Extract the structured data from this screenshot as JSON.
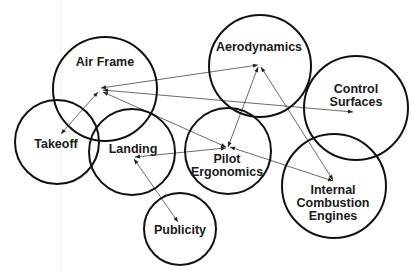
{
  "diagram": {
    "type": "concept-map",
    "style": {
      "line_color": "#444444",
      "circle_color": "#111111",
      "background": "#ffffff"
    },
    "nodes": [
      {
        "id": "airframe",
        "label_lines": [
          "Air Frame"
        ],
        "cx": 105,
        "cy": 89,
        "r": 52,
        "label_x": 105,
        "label_y": 66,
        "hub": [
          100,
          91
        ]
      },
      {
        "id": "aerodynamics",
        "label_lines": [
          "Aerodynamics"
        ],
        "cx": 260,
        "cy": 66,
        "r": 51,
        "label_x": 259,
        "label_y": 51,
        "hub": [
          259,
          66
        ]
      },
      {
        "id": "control_surfaces",
        "label_lines": [
          "Control",
          "Surfaces"
        ],
        "cx": 356,
        "cy": 108,
        "r": 52,
        "label_x": 356,
        "label_y": 92,
        "hub": [
          353,
          113
        ]
      },
      {
        "id": "takeoff",
        "label_lines": [
          "Takeoff"
        ],
        "cx": 57,
        "cy": 142,
        "r": 42,
        "label_x": 55,
        "label_y": 148,
        "hub": [
          61,
          135
        ]
      },
      {
        "id": "landing",
        "label_lines": [
          "Landing"
        ],
        "cx": 132,
        "cy": 152,
        "r": 43,
        "label_x": 132,
        "label_y": 153,
        "hub": [
          134,
          157
        ]
      },
      {
        "id": "pilot_ergonomics",
        "label_lines": [
          "Pilot",
          "Ergonomics"
        ],
        "cx": 228,
        "cy": 151,
        "r": 43,
        "label_x": 227,
        "label_y": 163,
        "hub": [
          228,
          146
        ]
      },
      {
        "id": "ice",
        "label_lines": [
          "Internal",
          "Combustion",
          "Engines"
        ],
        "cx": 334,
        "cy": 186,
        "r": 52,
        "label_x": 333,
        "label_y": 194,
        "hub": [
          334,
          180
        ]
      },
      {
        "id": "publicity",
        "label_lines": [
          "Publicity"
        ],
        "cx": 180,
        "cy": 229,
        "r": 36,
        "label_x": 180,
        "label_y": 234,
        "hub": [
          178,
          222
        ]
      }
    ],
    "edges": [
      {
        "from": [
          258,
          65
        ],
        "to": [
          101,
          88
        ],
        "heads": [
          "end",
          "start"
        ]
      },
      {
        "from": [
          353,
          112
        ],
        "to": [
          103,
          90
        ],
        "heads": [
          "start",
          "end"
        ]
      },
      {
        "from": [
          61,
          134
        ],
        "to": [
          98,
          92
        ],
        "heads": [
          "start",
          "end"
        ]
      },
      {
        "from": [
          226,
          147
        ],
        "to": [
          103,
          92
        ],
        "heads": [
          "start",
          "end"
        ]
      },
      {
        "from": [
          228,
          147
        ],
        "to": [
          258,
          67
        ],
        "heads": [
          "start",
          "end"
        ]
      },
      {
        "from": [
          333,
          180
        ],
        "to": [
          261,
          67
        ],
        "heads": [
          "start",
          "end"
        ]
      },
      {
        "from": [
          135,
          157
        ],
        "to": [
          226,
          148
        ],
        "heads": [
          "start",
          "end"
        ]
      },
      {
        "from": [
          230,
          147
        ],
        "to": [
          333,
          181
        ],
        "heads": [
          "start",
          "end"
        ]
      },
      {
        "from": [
          134,
          159
        ],
        "to": [
          178,
          222
        ],
        "heads": [
          "start",
          "end"
        ]
      }
    ]
  },
  "labels": {
    "airframe": "Air Frame",
    "aerodynamics": "Aerodynamics",
    "control_surfaces_1": "Control",
    "control_surfaces_2": "Surfaces",
    "takeoff": "Takeoff",
    "landing": "Landing",
    "pilot_1": "Pilot",
    "pilot_2": "Ergonomics",
    "ice_1": "Internal",
    "ice_2": "Combustion",
    "ice_3": "Engines",
    "publicity": "Publicity"
  }
}
